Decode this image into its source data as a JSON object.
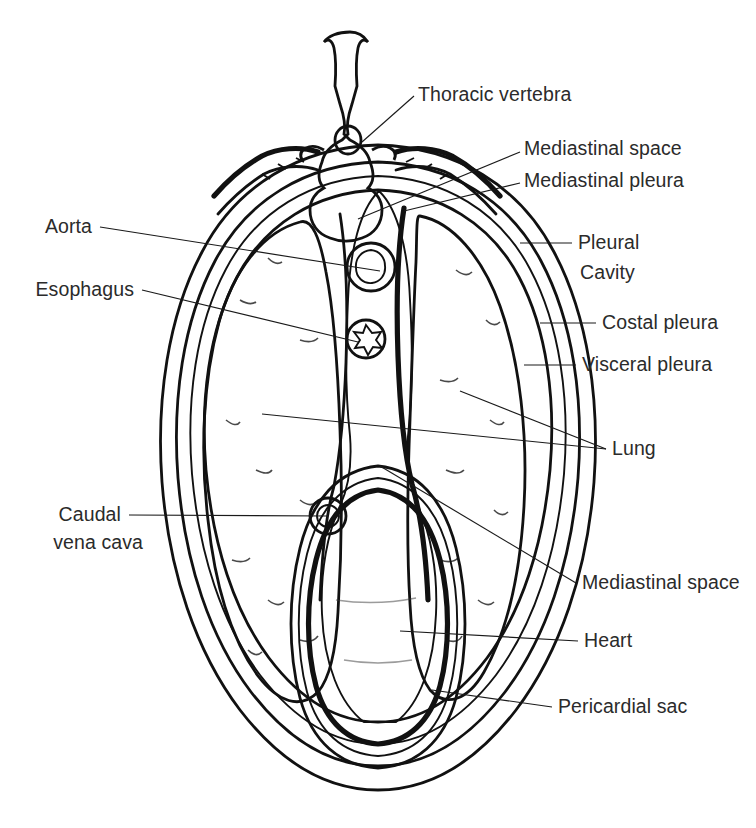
{
  "figure": {
    "background_color": "#ffffff",
    "ink_color": "#111111",
    "text_color": "#2b2b2b"
  },
  "palette": {
    "lung_fill": "#b4b4b4",
    "lung_speckle": "#2a2a2a",
    "heart_fill": "#6e6e6e",
    "pleural_fill": "#e8e8e8",
    "body_wall_fill": "#f4f4f4",
    "vessel_fill": "#8e8e8e",
    "vessel_lumen": "#5e5e5e",
    "cavity_fill": "#fbfbfb",
    "bone_fill": "#ffffff"
  },
  "labels": {
    "right": [
      {
        "id": "thoracic-vertebra",
        "text": "Thoracic vertebra",
        "x": 418,
        "y": 101
      },
      {
        "id": "mediastinal-space-upper",
        "text": "Mediastinal space",
        "x": 524,
        "y": 155
      },
      {
        "id": "mediastinal-pleura",
        "text": "Mediastinal pleura",
        "x": 524,
        "y": 187
      },
      {
        "id": "pleural-cavity-line1",
        "text": "Pleural",
        "x": 578,
        "y": 249
      },
      {
        "id": "pleural-cavity-line2",
        "text": "Cavity",
        "x": 580,
        "y": 279
      },
      {
        "id": "costal-pleura",
        "text": "Costal pleura",
        "x": 602,
        "y": 329
      },
      {
        "id": "visceral-pleura",
        "text": "Visceral pleura",
        "x": 582,
        "y": 371
      },
      {
        "id": "lung",
        "text": "Lung",
        "x": 612,
        "y": 455
      },
      {
        "id": "mediastinal-space-lower",
        "text": "Mediastinal space",
        "x": 582,
        "y": 589
      },
      {
        "id": "heart",
        "text": "Heart",
        "x": 584,
        "y": 647
      },
      {
        "id": "pericardial-sac",
        "text": "Pericardial sac",
        "x": 558,
        "y": 713
      }
    ],
    "left": [
      {
        "id": "aorta",
        "text": "Aorta",
        "x": 92,
        "y": 233
      },
      {
        "id": "esophagus",
        "text": "Esophagus",
        "x": 134,
        "y": 296
      },
      {
        "id": "caudal-vena-cava-line1",
        "text": "Caudal",
        "x": 121,
        "y": 521
      },
      {
        "id": "caudal-vena-cava-line2",
        "text": "vena cava",
        "x": 143,
        "y": 549
      }
    ]
  },
  "structures": [
    {
      "id": "thoracic-vertebra",
      "name": "Thoracic vertebra"
    },
    {
      "id": "rib-left",
      "name": "Rib (left)"
    },
    {
      "id": "rib-right",
      "name": "Rib (right)"
    },
    {
      "id": "body-wall",
      "name": "Thoracic body wall"
    },
    {
      "id": "costal-pleura",
      "name": "Costal pleura"
    },
    {
      "id": "pleural-cavity",
      "name": "Pleural cavity"
    },
    {
      "id": "visceral-pleura",
      "name": "Visceral pleura"
    },
    {
      "id": "lung-left",
      "name": "Left lung"
    },
    {
      "id": "lung-right",
      "name": "Right lung"
    },
    {
      "id": "mediastinal-pleura",
      "name": "Mediastinal pleura"
    },
    {
      "id": "mediastinal-space",
      "name": "Mediastinal space"
    },
    {
      "id": "aorta",
      "name": "Aorta"
    },
    {
      "id": "esophagus",
      "name": "Esophagus"
    },
    {
      "id": "caudal-vena-cava",
      "name": "Caudal vena cava"
    },
    {
      "id": "heart",
      "name": "Heart"
    },
    {
      "id": "pericardial-sac",
      "name": "Pericardial sac"
    }
  ]
}
